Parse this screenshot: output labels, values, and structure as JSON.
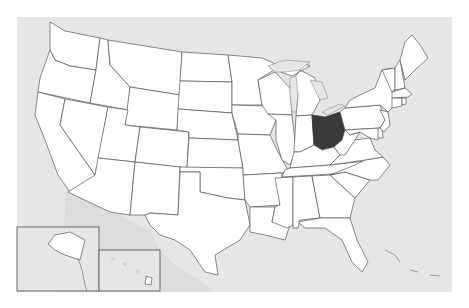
{
  "map": {
    "title": "United States",
    "highlighted_state": "Ohio",
    "colors": {
      "ocean": "#e6e6e6",
      "state_fill": "#ffffff",
      "state_border": "#555555",
      "highlight_fill": "#3a3a3a"
    },
    "insets": [
      {
        "name": "Alaska"
      },
      {
        "name": "Hawaii"
      }
    ]
  }
}
